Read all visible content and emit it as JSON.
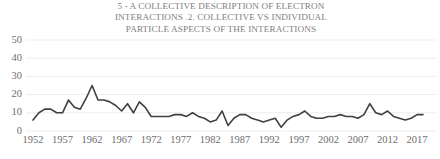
{
  "chart_data": {
    "type": "line",
    "title": "5 - A COLLECTIVE DESCRIPTION OF ELECTRON INTERACTIONS .2. COLLECTIVE VS INDIVIDUAL PARTICLE ASPECTS OF THE INTERACTIONS",
    "xlabel": "",
    "ylabel": "",
    "xlim": [
      1952,
      2018
    ],
    "ylim": [
      0,
      50
    ],
    "grid": true,
    "grid_axis": "y",
    "legend": false,
    "line_color": "#404040",
    "grid_color": "#ededed",
    "tick_color": "#6e6e6e",
    "title_color": "#808080",
    "y_ticks": [
      0,
      10,
      20,
      30,
      40,
      50
    ],
    "y_tick_labels": [
      "0",
      "10",
      "20",
      "30",
      "40",
      "50"
    ],
    "x_ticks": [
      1952,
      1957,
      1962,
      1967,
      1972,
      1977,
      1982,
      1987,
      1992,
      1997,
      2002,
      2007,
      2012,
      2017
    ],
    "x_tick_labels": [
      "1952",
      "1957",
      "1962",
      "1967",
      "1972",
      "1977",
      "1982",
      "1987",
      "1992",
      "1997",
      "2002",
      "2007",
      "2012",
      "2017"
    ],
    "x": [
      1952,
      1953,
      1954,
      1955,
      1956,
      1957,
      1958,
      1959,
      1960,
      1961,
      1962,
      1963,
      1964,
      1965,
      1966,
      1967,
      1968,
      1969,
      1970,
      1971,
      1972,
      1973,
      1974,
      1975,
      1976,
      1977,
      1978,
      1979,
      1980,
      1981,
      1982,
      1983,
      1984,
      1985,
      1986,
      1987,
      1988,
      1989,
      1990,
      1991,
      1992,
      1993,
      1994,
      1995,
      1996,
      1997,
      1998,
      1999,
      2000,
      2001,
      2002,
      2003,
      2004,
      2005,
      2006,
      2007,
      2008,
      2009,
      2010,
      2011,
      2012,
      2013,
      2014,
      2015,
      2016,
      2017,
      2018
    ],
    "values": [
      6,
      10,
      12,
      12,
      10,
      10,
      17,
      13,
      12,
      18,
      25,
      17,
      17,
      16,
      14,
      11,
      15,
      10,
      16,
      13,
      8,
      8,
      8,
      8,
      9,
      9,
      8,
      10,
      8,
      7,
      5,
      6,
      11,
      3,
      7,
      9,
      9,
      7,
      6,
      5,
      6,
      7,
      2,
      6,
      8,
      9,
      11,
      8,
      7,
      7,
      8,
      8,
      9,
      8,
      8,
      7,
      9,
      15,
      10,
      9,
      11,
      8,
      7,
      6,
      7,
      9,
      9
    ],
    "series_note": "annual publication counts"
  }
}
